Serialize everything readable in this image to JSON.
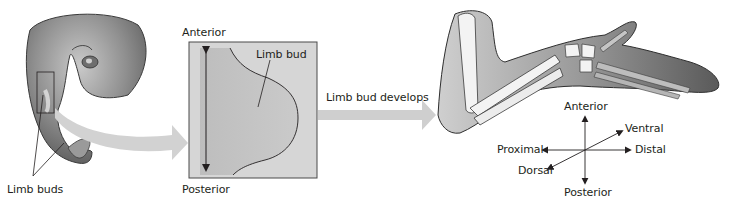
{
  "figure": {
    "embryo": {
      "label_limb_buds": "Limb buds"
    },
    "limb_bud_box": {
      "label_anterior": "Anterior",
      "label_posterior": "Posterior",
      "label_limb_bud": "Limb bud",
      "box_fill": "#d6d6d6",
      "bud_fill": "#c2c2c2"
    },
    "transition_arrow": {
      "label": "Limb bud develops",
      "color": "#cfcfcf"
    },
    "developed_limb": {
      "axes": {
        "anterior": "Anterior",
        "posterior": "Posterior",
        "proximal": "Proximal",
        "distal": "Distal",
        "ventral": "Ventral",
        "dorsal": "Dorsal"
      }
    }
  }
}
